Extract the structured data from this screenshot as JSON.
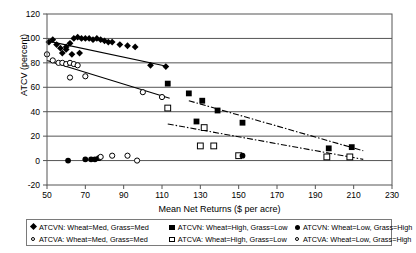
{
  "chart_data": {
    "type": "scatter",
    "title": "",
    "xlabel": "Mean Net Returns ($ per acre)",
    "ylabel": "ATCV (percent)",
    "xlim": [
      50,
      230
    ],
    "ylim": [
      -20,
      120
    ],
    "xticks": [
      50,
      70,
      90,
      110,
      130,
      150,
      170,
      190,
      210,
      230
    ],
    "yticks": [
      -20,
      0,
      20,
      40,
      60,
      80,
      100,
      120
    ],
    "grid": "horizontal",
    "legend_position": "below-plot",
    "series": [
      {
        "name": "ATCVN: Wheat=Med, Grass=Med",
        "marker": "diamond-filled",
        "points": [
          [
            51,
            97
          ],
          [
            53,
            99
          ],
          [
            55,
            95
          ],
          [
            57,
            92
          ],
          [
            58,
            88
          ],
          [
            60,
            93
          ],
          [
            62,
            96
          ],
          [
            64,
            100
          ],
          [
            66,
            101
          ],
          [
            68,
            100
          ],
          [
            70,
            100
          ],
          [
            72,
            100
          ],
          [
            74,
            99
          ],
          [
            76,
            100
          ],
          [
            78,
            99
          ],
          [
            80,
            98
          ],
          [
            82,
            97
          ],
          [
            84,
            97
          ],
          [
            88,
            95
          ],
          [
            92,
            94
          ],
          [
            96,
            93
          ],
          [
            60,
            91
          ],
          [
            63,
            87
          ],
          [
            67,
            88
          ],
          [
            104,
            78
          ],
          [
            112,
            77
          ]
        ]
      },
      {
        "name": "ATCVA: Wheat=Med, Grass=Med",
        "marker": "circle-open",
        "points": [
          [
            50,
            87
          ],
          [
            53,
            82
          ],
          [
            56,
            80
          ],
          [
            58,
            80
          ],
          [
            60,
            79
          ],
          [
            62,
            80
          ],
          [
            64,
            79
          ],
          [
            66,
            78
          ],
          [
            62,
            68
          ],
          [
            70,
            69
          ],
          [
            100,
            56
          ],
          [
            110,
            52
          ]
        ]
      },
      {
        "name": "ATCVN: Wheat=High, Grass=Low",
        "marker": "square-filled",
        "points": [
          [
            113,
            63
          ],
          [
            124,
            55
          ],
          [
            131,
            49
          ],
          [
            128,
            32
          ],
          [
            139,
            41
          ],
          [
            152,
            31
          ],
          [
            197,
            10
          ],
          [
            209,
            11
          ]
        ]
      },
      {
        "name": "ATCVA: Wheat=High, Grass=Low",
        "marker": "square-open",
        "points": [
          [
            113,
            43
          ],
          [
            132,
            27
          ],
          [
            130,
            12
          ],
          [
            137,
            12
          ],
          [
            150,
            4
          ],
          [
            196,
            3
          ],
          [
            208,
            3
          ]
        ]
      },
      {
        "name": "ATCVN: Wheat=Low, Grass=High",
        "marker": "circle-filled",
        "points": [
          [
            61,
            0
          ],
          [
            70,
            1
          ],
          [
            73,
            1
          ],
          [
            75,
            1
          ],
          [
            77,
            2
          ],
          [
            152,
            4
          ]
        ]
      },
      {
        "name": "ATCVA: Wheat=Low, Grass=High",
        "marker": "circle-open-small",
        "points": [
          [
            78,
            3
          ],
          [
            84,
            4
          ],
          [
            92,
            4
          ],
          [
            97,
            0
          ]
        ]
      }
    ],
    "trendlines": [
      {
        "name": "ATCVN Med trend",
        "style": "solid",
        "from": [
          50,
          98
        ],
        "to": [
          113,
          77
        ]
      },
      {
        "name": "ATCVA Med trend",
        "style": "solid",
        "from": [
          50,
          82
        ],
        "to": [
          114,
          51
        ]
      },
      {
        "name": "ATCVN High trend",
        "style": "dash-dot",
        "from": [
          124,
          49
        ],
        "to": [
          215,
          8
        ]
      },
      {
        "name": "ATCVA High trend",
        "style": "dash-dot",
        "from": [
          113,
          30
        ],
        "to": [
          215,
          1
        ]
      }
    ]
  },
  "axes": {
    "y_label": "ATCV (percent)",
    "x_label": "Mean Net Returns ($ per acre)",
    "y_ticks": [
      "120",
      "100",
      "80",
      "60",
      "40",
      "20",
      "0",
      "-20"
    ],
    "x_ticks": [
      "50",
      "70",
      "90",
      "110",
      "130",
      "150",
      "170",
      "190",
      "210",
      "230"
    ]
  },
  "legend": {
    "row1": [
      {
        "marker": "diamond-filled",
        "label": "ATCVN: Wheat=Med, Grass=Med"
      },
      {
        "marker": "square-filled",
        "label": "ATCVN: Wheat=High, Grass=Low"
      },
      {
        "marker": "circle-filled",
        "label": "ATCVN: Wheat=Low, Grass=High"
      }
    ],
    "row2": [
      {
        "marker": "circle-open",
        "label": "ATCVA: Wheat=Med, Grass=Med"
      },
      {
        "marker": "square-open",
        "label": "ATCVA: Wheat=High, Grass=Low"
      },
      {
        "marker": "circle-open",
        "label": "ATCVA: Wheat=Low, Grass=High"
      }
    ]
  }
}
